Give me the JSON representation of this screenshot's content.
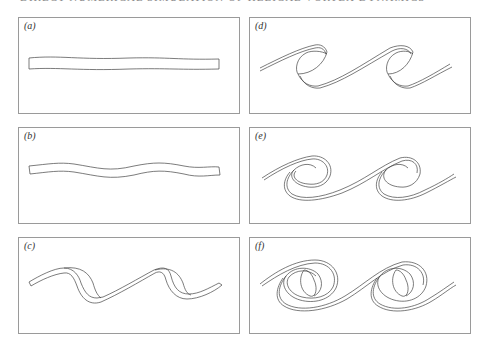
{
  "header": {
    "text": "DIRECT NUMERICAL SIMULATION OF HELICAL VORTEX DYNAMICS"
  },
  "figure": {
    "panels": [
      {
        "id": "a",
        "label": "(a)"
      },
      {
        "id": "b",
        "label": "(b)"
      },
      {
        "id": "c",
        "label": "(c)"
      },
      {
        "id": "d",
        "label": "(d)"
      },
      {
        "id": "e",
        "label": "(e)"
      },
      {
        "id": "f",
        "label": "(f)"
      }
    ]
  }
}
